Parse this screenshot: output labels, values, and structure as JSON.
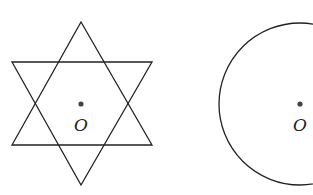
{
  "figures": [
    {
      "name": "hexagram",
      "center_label": "O"
    },
    {
      "name": "circle",
      "center_label": "O"
    }
  ],
  "colors": {
    "stroke": "#222222",
    "dot": "#444444",
    "background": "#ffffff"
  }
}
